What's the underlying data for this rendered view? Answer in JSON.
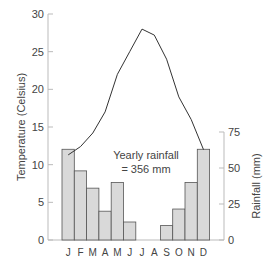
{
  "chart_data": {
    "type": "bar+line",
    "title": "",
    "categories": [
      "J",
      "F",
      "M",
      "A",
      "M",
      "J",
      "J",
      "A",
      "S",
      "O",
      "N",
      "D"
    ],
    "series": [
      {
        "name": "Rainfall",
        "type": "bar",
        "axis": "right",
        "values": [
          63,
          48,
          36,
          20,
          40,
          12.5,
          0,
          0,
          10,
          21.5,
          40,
          63
        ]
      },
      {
        "name": "Temperature",
        "type": "line",
        "axis": "left",
        "values": [
          11.3,
          12.4,
          14.2,
          17,
          22,
          25,
          28,
          27.2,
          24,
          19,
          16,
          12
        ]
      }
    ],
    "ylabel": "Temperature (Celsius)",
    "y2label": "Rainfall (mm)",
    "ylim": [
      0,
      30
    ],
    "y2lim": [
      0,
      75
    ],
    "yticks": [
      0,
      5,
      10,
      15,
      20,
      25,
      30
    ],
    "y2ticks": [
      0,
      25,
      50,
      75
    ],
    "annotation": {
      "line1": "Yearly rainfall",
      "line2": "= 356 mm"
    },
    "grid": false,
    "legend": "none"
  },
  "colors": {
    "bar_fill": "#d9d9d9",
    "bar_stroke": "#555555",
    "line": "#333333",
    "axis": "#bbbbbb",
    "text": "#444444"
  }
}
